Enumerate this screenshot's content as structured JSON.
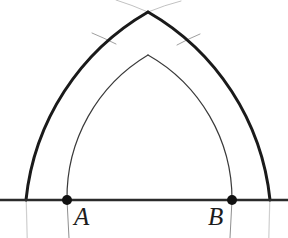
{
  "figure": {
    "background_color": "#ffffff",
    "width": 288,
    "height": 238,
    "labels": [
      {
        "name": "A",
        "text": "A",
        "x": 74,
        "y": 204
      },
      {
        "name": "B",
        "text": "B",
        "x": 208,
        "y": 204
      }
    ],
    "points": [
      {
        "name": "A",
        "x": 67,
        "y": 200,
        "radius": 5,
        "color": "#111111"
      },
      {
        "name": "B",
        "x": 232,
        "y": 200,
        "radius": 5,
        "color": "#111111"
      }
    ],
    "baseline": {
      "x1": 0,
      "y1": 200,
      "x2": 288,
      "y2": 200,
      "color": "#2b2b2b",
      "width": 2.4
    },
    "apex": {
      "x": 148,
      "y": 12
    },
    "inner_apex": {
      "x": 148,
      "y": 55
    },
    "colors": {
      "thick_stroke": "#1a1a1a",
      "thin_stroke": "#3a3a3a",
      "faint_stroke": "#b9b9b9",
      "baseline": "#2b2b2b",
      "point_fill": "#111111",
      "background": "#ffffff"
    },
    "stroke_widths": {
      "thick": 3.0,
      "thin": 1.1,
      "faint": 0.9,
      "baseline": 2.4
    },
    "outer_arch": {
      "description": "outer pointed arch, thick stroke",
      "left_foot_x": 26,
      "right_foot_x": 270,
      "apex_x": 148,
      "apex_y": 12
    },
    "inner_arch": {
      "description": "inner pointed arch through A and B, thin stroke",
      "left_foot_x": 67,
      "right_foot_x": 232,
      "apex_x": 148,
      "apex_y": 55
    },
    "construction_tails": {
      "description": "faint construction line extensions beyond the arcs",
      "left_tail_end_x": 92,
      "left_tail_end_y": 33,
      "right_tail_end_x": 200,
      "right_tail_end_y": 34,
      "apex_left_end_x": 116,
      "apex_left_end_y": 0,
      "apex_right_end_x": 181,
      "apex_right_end_y": 0
    }
  }
}
